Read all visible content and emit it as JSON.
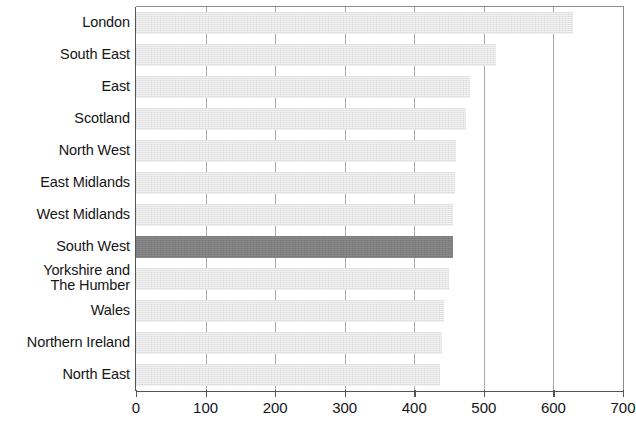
{
  "chart_data": {
    "type": "bar",
    "orientation": "horizontal",
    "title": "",
    "subtitle": "",
    "xlabel": "",
    "ylabel": "",
    "xlim": [
      0,
      700
    ],
    "ylim": null,
    "grid": "vertical-only",
    "legend": "none",
    "highlight_category": "South West",
    "categories": [
      "London",
      "South East",
      "East",
      "Scotland",
      "North West",
      "East Midlands",
      "West Midlands",
      "South West",
      "Yorkshire and\nThe Humber",
      "Wales",
      "Northern Ireland",
      "North East"
    ],
    "values": [
      628,
      517,
      480,
      474,
      460,
      458,
      456,
      455,
      450,
      442,
      440,
      437
    ],
    "xticks": [
      0,
      100,
      200,
      300,
      400,
      500,
      600,
      700
    ],
    "xtick_labels": [
      "0",
      "100",
      "200",
      "300",
      "400",
      "500",
      "600",
      "700"
    ],
    "colors": {
      "bar_default": "#e4e4e4",
      "bar_highlight": "#7e7e7e",
      "axis": "#555555",
      "gridline": "#a8a8a8",
      "text": "#151515",
      "background": "#ffffff"
    }
  }
}
